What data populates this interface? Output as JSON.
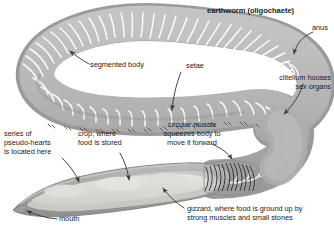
{
  "figure": {
    "title": "earthworm (oligochaete)",
    "subject": "earthworm",
    "background_color": "#ffffff",
    "body_color": "#b4b4b4",
    "body_shade_color": "#9e9e9e",
    "body_light_color": "#cfcfcf",
    "segment_line_color": "#ffffff",
    "organ_color": "#d8d8d6",
    "organ_light_color": "#e6e6e2",
    "outline_color": "#8a8a88",
    "label_color": "#1c1c1c",
    "leader_color": "#3a3a3a"
  },
  "labels": {
    "title": "earthworm (oligochaete)",
    "anus": "anus",
    "segmented_body": "segmented body",
    "setae": "setae",
    "clitellum_line1": "clitellum houses",
    "clitellum_line2": "sex organs",
    "circular_muscle_line1": "circular muscle",
    "circular_muscle_line2": "squeezes body to",
    "circular_muscle_line3": "move it forward",
    "pseudohearts_line1": "series of",
    "pseudohearts_line2": "pseudo-hearts",
    "pseudohearts_line3": "is located here",
    "crop_line1": "crop, where",
    "crop_line2": "food is stored",
    "gizzard_line1": "gizzard, where food is ground up by",
    "gizzard_line2": "strong muscles and small stones",
    "mouth": "mouth"
  },
  "callouts": [
    {
      "id": "anus",
      "text": "anus",
      "target": "posterior tip of worm"
    },
    {
      "id": "segmented-body",
      "text": "segmented body",
      "target": "upper left coil of worm"
    },
    {
      "id": "setae",
      "text": "setae",
      "target": "bristles on ventral edge"
    },
    {
      "id": "clitellum",
      "text": "clitellum houses sex organs",
      "target": "thickened band on right bend"
    },
    {
      "id": "circular-muscle",
      "text": "circular muscle squeezes body to move it forward",
      "target": "ribbed muscle section"
    },
    {
      "id": "pseudo-hearts",
      "text": "series of pseudo-hearts is located here",
      "target": "anterior interior of cutaway"
    },
    {
      "id": "crop",
      "text": "crop, where food is stored",
      "target": "mid interior of cutaway"
    },
    {
      "id": "gizzard",
      "text": "gizzard, where food is ground up by strong muscles and small stones",
      "target": "posterior interior of cutaway"
    },
    {
      "id": "mouth",
      "text": "mouth",
      "target": "anterior tip of cutaway"
    }
  ]
}
